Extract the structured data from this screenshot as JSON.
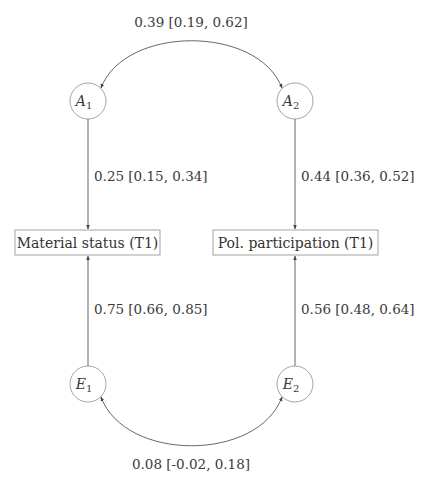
{
  "diagram": {
    "type": "path-diagram",
    "colors": {
      "line": "#555555",
      "circle": "#9a9a9a",
      "box": "#9a9a9a",
      "text": "#333333"
    },
    "latent_nodes": [
      {
        "id": "A1",
        "letter": "A",
        "sub": "1"
      },
      {
        "id": "A2",
        "letter": "A",
        "sub": "2"
      },
      {
        "id": "E1",
        "letter": "E",
        "sub": "1"
      },
      {
        "id": "E2",
        "letter": "E",
        "sub": "2"
      }
    ],
    "observed_nodes": [
      {
        "id": "ms",
        "label": "Material status (T1)"
      },
      {
        "id": "pp",
        "label": "Pol. participation (T1)"
      }
    ],
    "paths": [
      {
        "from": "A1",
        "to": "ms",
        "label": "0.25 [0.15, 0.34]"
      },
      {
        "from": "A2",
        "to": "pp",
        "label": "0.44 [0.36, 0.52]"
      },
      {
        "from": "E1",
        "to": "ms",
        "label": "0.75 [0.66, 0.85]"
      },
      {
        "from": "E2",
        "to": "pp",
        "label": "0.56 [0.48, 0.64]"
      }
    ],
    "covariances": [
      {
        "between": [
          "A1",
          "A2"
        ],
        "label": "0.39 [0.19, 0.62]"
      },
      {
        "between": [
          "E1",
          "E2"
        ],
        "label": "0.08 [-0.02, 0.18]"
      }
    ]
  }
}
